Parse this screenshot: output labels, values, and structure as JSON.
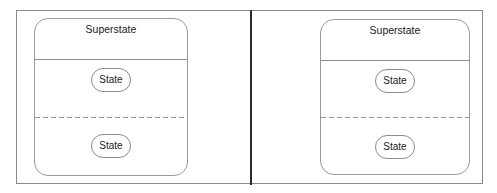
{
  "diagrams": [
    {
      "superstate": {
        "title": "Superstate",
        "regions": [
          {
            "separator": "solid",
            "state": {
              "label": "State"
            }
          },
          {
            "separator": "dashed",
            "state": {
              "label": "State"
            }
          }
        ]
      }
    },
    {
      "superstate": {
        "title": "Superstate",
        "regions": [
          {
            "separator": "solid",
            "state": {
              "label": "State"
            }
          },
          {
            "separator": "dashed",
            "state": {
              "label": "State"
            }
          }
        ]
      }
    }
  ],
  "colors": {
    "frame_border": "#8a8a8a",
    "divider": "#2a2a2a",
    "shape_border": "#9a9a9a",
    "text": "#222222"
  }
}
